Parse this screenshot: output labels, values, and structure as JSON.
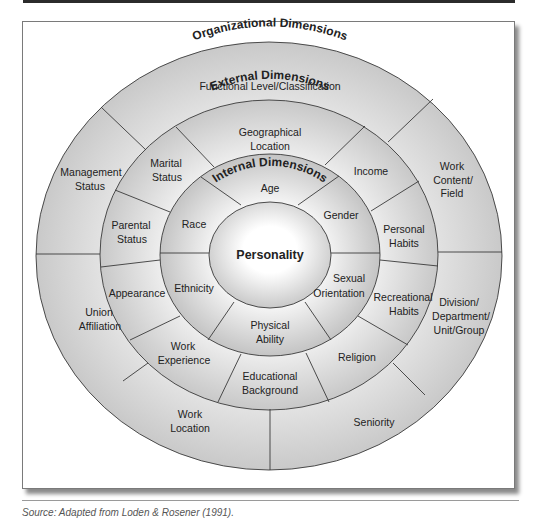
{
  "diagram": {
    "core": {
      "label": "Personality"
    },
    "rings": {
      "internal": {
        "title": "Internal Dimensions",
        "segments": [
          {
            "id": "age",
            "lines": [
              "Age"
            ]
          },
          {
            "id": "gender",
            "lines": [
              "Gender"
            ]
          },
          {
            "id": "sexual-orientation",
            "lines": [
              "Sexual",
              "Orientation"
            ]
          },
          {
            "id": "physical-ability",
            "lines": [
              "Physical",
              "Ability"
            ]
          },
          {
            "id": "ethnicity",
            "lines": [
              "Ethnicity"
            ]
          },
          {
            "id": "race",
            "lines": [
              "Race"
            ]
          }
        ]
      },
      "external": {
        "title": "External Dimensions",
        "segments": [
          {
            "id": "geographical-location",
            "lines": [
              "Geographical",
              "Location"
            ]
          },
          {
            "id": "income",
            "lines": [
              "Income"
            ]
          },
          {
            "id": "personal-habits",
            "lines": [
              "Personal",
              "Habits"
            ]
          },
          {
            "id": "recreational-habits",
            "lines": [
              "Recreational",
              "Habits"
            ]
          },
          {
            "id": "religion",
            "lines": [
              "Religion"
            ]
          },
          {
            "id": "educational-background",
            "lines": [
              "Educational",
              "Background"
            ]
          },
          {
            "id": "work-experience",
            "lines": [
              "Work",
              "Experience"
            ]
          },
          {
            "id": "appearance",
            "lines": [
              "Appearance"
            ]
          },
          {
            "id": "parental-status",
            "lines": [
              "Parental",
              "Status"
            ]
          },
          {
            "id": "marital-status",
            "lines": [
              "Marital",
              "Status"
            ]
          }
        ]
      },
      "organizational": {
        "title": "Organizational Dimensions",
        "segments": [
          {
            "id": "functional-level",
            "lines": [
              "Functional Level/Classification"
            ]
          },
          {
            "id": "work-content",
            "lines": [
              "Work",
              "Content/",
              "Field"
            ]
          },
          {
            "id": "division",
            "lines": [
              "Division/",
              "Department/",
              "Unit/Group"
            ]
          },
          {
            "id": "seniority",
            "lines": [
              "Seniority"
            ]
          },
          {
            "id": "work-location",
            "lines": [
              "Work",
              "Location"
            ]
          },
          {
            "id": "union-affiliation",
            "lines": [
              "Union",
              "Affiliation"
            ]
          },
          {
            "id": "management-status",
            "lines": [
              "Management",
              "Status"
            ]
          }
        ]
      }
    }
  },
  "caption": "Source: Adapted from Loden & Rosener (1991)."
}
